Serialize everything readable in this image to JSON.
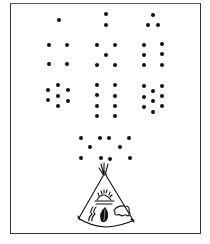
{
  "illustration": {
    "subject": "dot counting puzzle with tipi",
    "ink_color": "#111111",
    "frame": {
      "x": 10,
      "y": 3,
      "w": 191,
      "h": 231
    },
    "dot_radius": 2,
    "groups": [
      {
        "count": 1,
        "dots": [
          [
            59,
            20
          ]
        ]
      },
      {
        "count": 2,
        "dots": [
          [
            106,
            14
          ],
          [
            106,
            25
          ]
        ]
      },
      {
        "count": 3,
        "dots": [
          [
            153,
            15
          ],
          [
            148,
            25
          ],
          [
            158,
            25
          ]
        ]
      },
      {
        "count": 4,
        "dots": [
          [
            49,
            45
          ],
          [
            67,
            45
          ],
          [
            49,
            64
          ],
          [
            67,
            64
          ]
        ]
      },
      {
        "count": 5,
        "dots": [
          [
            97,
            45
          ],
          [
            115,
            45
          ],
          [
            106,
            55
          ],
          [
            97,
            65
          ],
          [
            115,
            65
          ]
        ]
      },
      {
        "count": 6,
        "dots": [
          [
            144,
            45
          ],
          [
            162,
            44
          ],
          [
            144,
            55
          ],
          [
            162,
            54
          ],
          [
            144,
            65
          ],
          [
            162,
            65
          ]
        ]
      },
      {
        "count": 7,
        "dots": [
          [
            48,
            90
          ],
          [
            58,
            85
          ],
          [
            68,
            90
          ],
          [
            48,
            100
          ],
          [
            58,
            96
          ],
          [
            68,
            101
          ],
          [
            58,
            106
          ]
        ]
      },
      {
        "count": 8,
        "dots": [
          [
            97,
            85
          ],
          [
            115,
            85
          ],
          [
            97,
            95
          ],
          [
            115,
            96
          ],
          [
            97,
            106
          ],
          [
            115,
            106
          ],
          [
            97,
            116
          ],
          [
            115,
            116
          ]
        ]
      },
      {
        "count": 9,
        "dots": [
          [
            144,
            86
          ],
          [
            153,
            91
          ],
          [
            162,
            86
          ],
          [
            144,
            97
          ],
          [
            153,
            101
          ],
          [
            162,
            96
          ],
          [
            144,
            107
          ],
          [
            153,
            112
          ],
          [
            162,
            106
          ]
        ]
      },
      {
        "count": 10,
        "dots": [
          [
            81,
            138
          ],
          [
            100,
            138
          ],
          [
            109,
            138
          ],
          [
            129,
            138
          ],
          [
            90,
            147
          ],
          [
            120,
            147
          ],
          [
            81,
            158
          ],
          [
            101,
            158
          ],
          [
            110,
            159
          ],
          [
            130,
            158
          ]
        ]
      }
    ],
    "tipi": {
      "symbols": [
        "sun-rising",
        "lightning-wavy-lines",
        "leaf",
        "buffalo"
      ]
    }
  }
}
